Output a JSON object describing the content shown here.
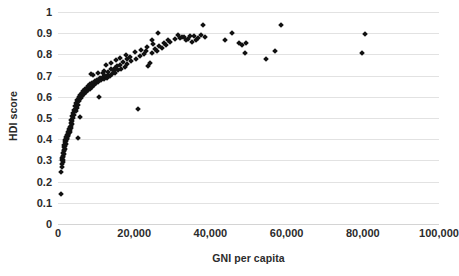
{
  "chart_data": {
    "type": "scatter",
    "title": "",
    "xlabel": "GNI per capita",
    "ylabel": "HDI score",
    "xlim": [
      0,
      100000
    ],
    "ylim": [
      0,
      1
    ],
    "xticks": [
      0,
      20000,
      40000,
      60000,
      80000,
      100000
    ],
    "xtick_labels": [
      "0",
      "20,000",
      "40,000",
      "60,000",
      "80,000",
      "100,000"
    ],
    "yticks": [
      0,
      0.1,
      0.2,
      0.3,
      0.4,
      0.5,
      0.6,
      0.7,
      0.8,
      0.9,
      1
    ],
    "ytick_labels": [
      "0",
      "0.1",
      "0.2",
      "0.3",
      "0.4",
      "0.5",
      "0.6",
      "0.7",
      "0.8",
      "0.9",
      "1"
    ],
    "grid": "horizontal",
    "legend": "none",
    "marker": "diamond",
    "marker_color": "#111111",
    "points": [
      [
        760,
        0.142
      ],
      [
        900,
        0.243
      ],
      [
        1100,
        0.268
      ],
      [
        1000,
        0.282
      ],
      [
        1250,
        0.291
      ],
      [
        1150,
        0.3
      ],
      [
        1300,
        0.304
      ],
      [
        980,
        0.31
      ],
      [
        1400,
        0.315
      ],
      [
        1200,
        0.322
      ],
      [
        1550,
        0.33
      ],
      [
        1350,
        0.337
      ],
      [
        1650,
        0.344
      ],
      [
        1480,
        0.351
      ],
      [
        1750,
        0.356
      ],
      [
        1600,
        0.362
      ],
      [
        1900,
        0.368
      ],
      [
        1700,
        0.374
      ],
      [
        2000,
        0.379
      ],
      [
        1820,
        0.385
      ],
      [
        2150,
        0.39
      ],
      [
        1950,
        0.395
      ],
      [
        2300,
        0.399
      ],
      [
        2050,
        0.403
      ],
      [
        2450,
        0.407
      ],
      [
        2200,
        0.41
      ],
      [
        2600,
        0.414
      ],
      [
        2350,
        0.418
      ],
      [
        2750,
        0.421
      ],
      [
        2500,
        0.425
      ],
      [
        2900,
        0.428
      ],
      [
        2650,
        0.432
      ],
      [
        3050,
        0.436
      ],
      [
        2800,
        0.44
      ],
      [
        3200,
        0.444
      ],
      [
        2950,
        0.448
      ],
      [
        3350,
        0.452
      ],
      [
        3100,
        0.456
      ],
      [
        5200,
        0.404
      ],
      [
        3400,
        0.463
      ],
      [
        3600,
        0.47
      ],
      [
        3300,
        0.477
      ],
      [
        3800,
        0.484
      ],
      [
        3500,
        0.492
      ],
      [
        4000,
        0.498
      ],
      [
        5700,
        0.503
      ],
      [
        3700,
        0.508
      ],
      [
        4300,
        0.515
      ],
      [
        3900,
        0.523
      ],
      [
        4600,
        0.531
      ],
      [
        4200,
        0.54
      ],
      [
        4900,
        0.548
      ],
      [
        4500,
        0.556
      ],
      [
        5200,
        0.563
      ],
      [
        4800,
        0.571
      ],
      [
        5600,
        0.578
      ],
      [
        5100,
        0.585
      ],
      [
        6000,
        0.592
      ],
      [
        5400,
        0.598
      ],
      [
        6400,
        0.603
      ],
      [
        5800,
        0.608
      ],
      [
        10800,
        0.601
      ],
      [
        6800,
        0.613
      ],
      [
        6200,
        0.618
      ],
      [
        7300,
        0.622
      ],
      [
        6600,
        0.627
      ],
      [
        7800,
        0.631
      ],
      [
        7000,
        0.635
      ],
      [
        8300,
        0.639
      ],
      [
        7500,
        0.643
      ],
      [
        8800,
        0.647
      ],
      [
        8000,
        0.651
      ],
      [
        9400,
        0.655
      ],
      [
        8500,
        0.659
      ],
      [
        10000,
        0.663
      ],
      [
        9000,
        0.667
      ],
      [
        10600,
        0.67
      ],
      [
        9600,
        0.674
      ],
      [
        11300,
        0.677
      ],
      [
        10200,
        0.681
      ],
      [
        12000,
        0.684
      ],
      [
        11000,
        0.688
      ],
      [
        12800,
        0.691
      ],
      [
        11700,
        0.694
      ],
      [
        13600,
        0.697
      ],
      [
        12400,
        0.7
      ],
      [
        9300,
        0.702
      ],
      [
        13200,
        0.704
      ],
      [
        8700,
        0.706
      ],
      [
        14200,
        0.708
      ],
      [
        10500,
        0.71
      ],
      [
        15000,
        0.712
      ],
      [
        11900,
        0.714
      ],
      [
        13000,
        0.717
      ],
      [
        14600,
        0.72
      ],
      [
        12200,
        0.723
      ],
      [
        15800,
        0.726
      ],
      [
        13800,
        0.73
      ],
      [
        16600,
        0.733
      ],
      [
        14900,
        0.737
      ],
      [
        17500,
        0.74
      ],
      [
        15500,
        0.744
      ],
      [
        12600,
        0.748
      ],
      [
        16200,
        0.752
      ],
      [
        18200,
        0.756
      ],
      [
        14000,
        0.76
      ],
      [
        17000,
        0.764
      ],
      [
        19200,
        0.768
      ],
      [
        15200,
        0.772
      ],
      [
        18000,
        0.776
      ],
      [
        20400,
        0.78
      ],
      [
        16400,
        0.784
      ],
      [
        23600,
        0.745
      ],
      [
        24200,
        0.758
      ],
      [
        19000,
        0.789
      ],
      [
        21500,
        0.793
      ],
      [
        17800,
        0.797
      ],
      [
        22600,
        0.801
      ],
      [
        24800,
        0.805
      ],
      [
        20200,
        0.81
      ],
      [
        23000,
        0.814
      ],
      [
        26000,
        0.818
      ],
      [
        21800,
        0.822
      ],
      [
        25400,
        0.826
      ],
      [
        27200,
        0.83
      ],
      [
        23400,
        0.835
      ],
      [
        26600,
        0.84
      ],
      [
        28400,
        0.845
      ],
      [
        25000,
        0.85
      ],
      [
        27800,
        0.855
      ],
      [
        29400,
        0.86
      ],
      [
        24600,
        0.866
      ],
      [
        29000,
        0.87
      ],
      [
        30600,
        0.873
      ],
      [
        26200,
        0.9
      ],
      [
        32000,
        0.878
      ],
      [
        33200,
        0.884
      ],
      [
        34600,
        0.888
      ],
      [
        31400,
        0.891
      ],
      [
        35800,
        0.886
      ],
      [
        36800,
        0.878
      ],
      [
        34000,
        0.874
      ],
      [
        37500,
        0.893
      ],
      [
        38600,
        0.884
      ],
      [
        36200,
        0.866
      ],
      [
        35200,
        0.858
      ],
      [
        38000,
        0.94
      ],
      [
        33600,
        0.87
      ],
      [
        32600,
        0.882
      ],
      [
        43800,
        0.866
      ],
      [
        45800,
        0.901
      ],
      [
        47600,
        0.852
      ],
      [
        48400,
        0.842
      ],
      [
        49400,
        0.855
      ],
      [
        49000,
        0.806
      ],
      [
        54600,
        0.776
      ],
      [
        57000,
        0.816
      ],
      [
        58400,
        0.938
      ],
      [
        20900,
        0.541
      ],
      [
        79800,
        0.806
      ],
      [
        80600,
        0.895
      ]
    ]
  }
}
